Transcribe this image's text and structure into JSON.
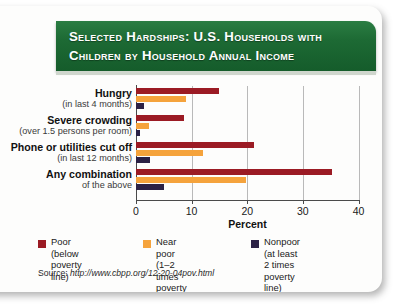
{
  "header": {
    "title": "Selected Hardships: U.S. Households with\nChildren by Household Annual Income"
  },
  "source": {
    "prefix": "Source: ",
    "url": "http://www.cbpp.org/12-20-04pov.html"
  },
  "legend": [
    {
      "name": "poor",
      "label": "Poor (below\npoverty line)",
      "color": "#9b1b24"
    },
    {
      "name": "near-poor",
      "label": "Near poor (1–2 times\npoverty line)",
      "color": "#f5a33c"
    },
    {
      "name": "nonpoor",
      "label": "Nonpoor (at least 2 times\npoverty line)",
      "color": "#2b2145"
    }
  ],
  "categories_display": [
    {
      "main": "Hungry",
      "sub": "(in last 4 months)"
    },
    {
      "main": "Severe crowding",
      "sub": "(over 1.5 persons per room)"
    },
    {
      "main": "Phone or utilities cut off",
      "sub": "(in last 12 months)"
    },
    {
      "main": "Any combination",
      "sub": "of the above"
    }
  ],
  "axis": {
    "ticks": [
      "0",
      "10",
      "20",
      "30",
      "40"
    ]
  },
  "chart_data": {
    "type": "bar",
    "orientation": "horizontal",
    "title": "Selected Hardships: U.S. Households with Children by Household Annual Income",
    "xlabel": "Percent",
    "ylabel": "",
    "xlim": [
      0,
      40
    ],
    "xticks": [
      0,
      10,
      20,
      30,
      40
    ],
    "grid": true,
    "legend_position": "bottom",
    "categories": [
      "Hungry (in last 4 months)",
      "Severe crowding (over 1.5 persons per room)",
      "Phone or utilities cut off (in last 12 months)",
      "Any combination of the above"
    ],
    "series": [
      {
        "name": "Poor (below poverty line)",
        "color": "#9b1b24",
        "values": [
          14.9,
          8.7,
          21.3,
          35.3
        ]
      },
      {
        "name": "Near poor (1–2 times poverty line)",
        "color": "#f5a33c",
        "values": [
          9.0,
          2.4,
          12.0,
          19.7
        ]
      },
      {
        "name": "Nonpoor (at least 2 times poverty line)",
        "color": "#2b2145",
        "values": [
          1.5,
          0.8,
          2.6,
          5.0
        ]
      }
    ]
  }
}
